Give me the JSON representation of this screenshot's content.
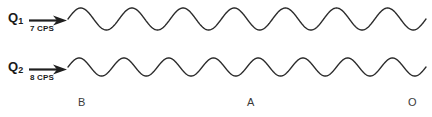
{
  "figure": {
    "background_color": "#ffffff",
    "stroke_color": "#2b2b2b"
  },
  "sources": [
    {
      "id": "q1",
      "label_main": "Q",
      "label_sub": "1",
      "frequency_text": "7 CPS",
      "frequency_value": 7,
      "frequency_unit": "CPS",
      "arrow_icon": "right-arrow-icon"
    },
    {
      "id": "q2",
      "label_main": "Q",
      "label_sub": "2",
      "frequency_text": "8 CPS",
      "frequency_value": 8,
      "frequency_unit": "CPS",
      "arrow_icon": "right-arrow-icon"
    }
  ],
  "position_markers": [
    {
      "label": "B",
      "x": 78
    },
    {
      "label": "A",
      "x": 247
    },
    {
      "label": "O",
      "x": 408
    }
  ],
  "chart_data": {
    "type": "line",
    "xlabel": "",
    "ylabel": "",
    "grid": false,
    "legend": "none",
    "x_start": 68,
    "x_end": 426,
    "series": [
      {
        "name": "Q1",
        "cycles": 7,
        "amplitude": 11,
        "baseline_y": 19,
        "phase_deg": 0,
        "stroke_width": 1.4
      },
      {
        "name": "Q2",
        "cycles": 8,
        "amplitude": 9,
        "baseline_y": 67,
        "phase_deg": 0,
        "stroke_width": 1.4
      }
    ]
  }
}
